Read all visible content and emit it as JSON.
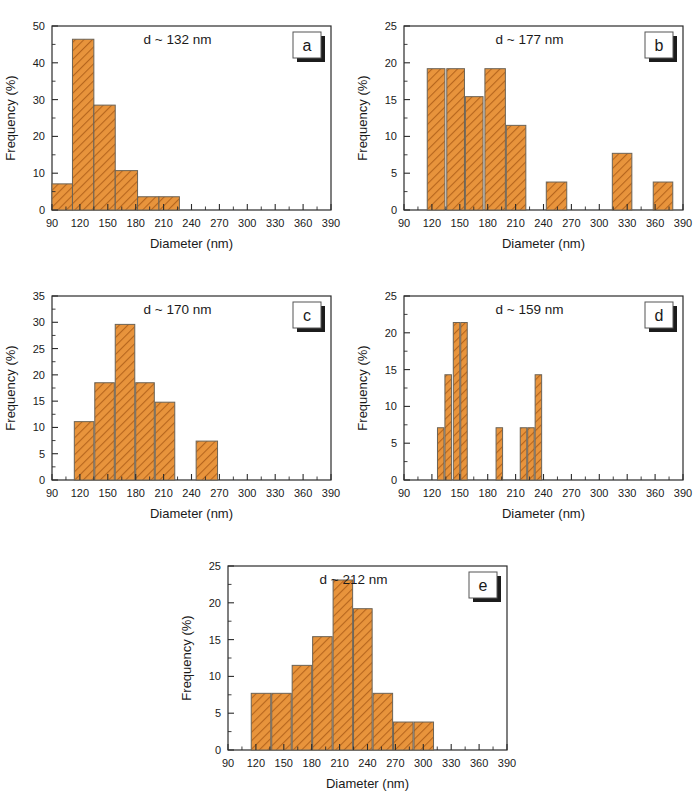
{
  "figure": {
    "axis_x_label": "Diameter (nm)",
    "axis_y_label": "Frequency (%)",
    "bar_fill_color": "#E8943C",
    "bar_hatch_color": "#B5651D",
    "bar_edge_color": "#6B6356"
  },
  "panels": [
    {
      "letter": "a",
      "annotation": "d ~ 132 nm",
      "chart_data": {
        "type": "bar",
        "title": "d ~ 132 nm",
        "xlabel": "Diameter (nm)",
        "ylabel": "Frequency (%)",
        "xlim": [
          90,
          390
        ],
        "ylim": [
          0,
          50
        ],
        "xticks": [
          90,
          120,
          150,
          180,
          210,
          240,
          270,
          300,
          330,
          360,
          390
        ],
        "yticks": [
          0,
          10,
          20,
          30,
          40,
          50
        ],
        "grid": false,
        "bin_edges": [
          90,
          112,
          135,
          158,
          182,
          205,
          227
        ],
        "bin_centers": [
          101,
          123,
          146,
          170,
          193,
          216
        ],
        "values": [
          7.1,
          46.4,
          28.5,
          10.7,
          3.6,
          3.6
        ]
      }
    },
    {
      "letter": "b",
      "annotation": "d ~ 177 nm",
      "chart_data": {
        "type": "bar",
        "title": "d ~ 177 nm",
        "xlabel": "Diameter (nm)",
        "ylabel": "Frequency (%)",
        "xlim": [
          90,
          390
        ],
        "ylim": [
          0,
          25
        ],
        "xticks": [
          90,
          120,
          150,
          180,
          210,
          240,
          270,
          300,
          330,
          360,
          390
        ],
        "yticks": [
          0,
          5,
          10,
          15,
          20,
          25
        ],
        "grid": false,
        "bars": [
          {
            "x0": 115,
            "x1": 134,
            "value": 19.2
          },
          {
            "x0": 136,
            "x1": 155,
            "value": 19.2
          },
          {
            "x0": 156,
            "x1": 175,
            "value": 15.4
          },
          {
            "x0": 177,
            "x1": 199,
            "value": 19.2
          },
          {
            "x0": 200,
            "x1": 221,
            "value": 11.5
          },
          {
            "x0": 243,
            "x1": 265,
            "value": 3.8
          },
          {
            "x0": 314,
            "x1": 335,
            "value": 7.7
          },
          {
            "x0": 358,
            "x1": 379,
            "value": 3.8
          }
        ]
      }
    },
    {
      "letter": "c",
      "annotation": "d ~ 170 nm",
      "chart_data": {
        "type": "bar",
        "title": "d ~ 170 nm",
        "xlabel": "Diameter (nm)",
        "ylabel": "Frequency (%)",
        "xlim": [
          90,
          390
        ],
        "ylim": [
          0,
          35
        ],
        "xticks": [
          90,
          120,
          150,
          180,
          210,
          240,
          270,
          300,
          330,
          360,
          390
        ],
        "yticks": [
          0,
          5,
          10,
          15,
          20,
          25,
          30,
          35
        ],
        "grid": false,
        "bars": [
          {
            "x0": 114,
            "x1": 135,
            "value": 11.1
          },
          {
            "x0": 136,
            "x1": 157,
            "value": 18.5
          },
          {
            "x0": 158,
            "x1": 179,
            "value": 29.6
          },
          {
            "x0": 180,
            "x1": 200,
            "value": 18.5
          },
          {
            "x0": 201,
            "x1": 222,
            "value": 14.8
          },
          {
            "x0": 245,
            "x1": 268,
            "value": 7.4
          }
        ]
      }
    },
    {
      "letter": "d",
      "annotation": "d ~ 159 nm",
      "chart_data": {
        "type": "bar",
        "title": "d ~ 159 nm",
        "xlabel": "Diameter (nm)",
        "ylabel": "Frequency (%)",
        "xlim": [
          90,
          390
        ],
        "ylim": [
          0,
          25
        ],
        "xticks": [
          90,
          120,
          150,
          180,
          210,
          240,
          270,
          300,
          330,
          360,
          390
        ],
        "yticks": [
          0,
          5,
          10,
          15,
          20,
          25
        ],
        "grid": false,
        "bars": [
          {
            "x0": 126,
            "x1": 133,
            "value": 7.1
          },
          {
            "x0": 134,
            "x1": 141,
            "value": 14.3
          },
          {
            "x0": 143,
            "x1": 150,
            "value": 21.4
          },
          {
            "x0": 151,
            "x1": 158,
            "value": 21.4
          },
          {
            "x0": 189,
            "x1": 196,
            "value": 7.1
          },
          {
            "x0": 215,
            "x1": 222,
            "value": 7.1
          },
          {
            "x0": 223,
            "x1": 230,
            "value": 7.1
          },
          {
            "x0": 231,
            "x1": 238,
            "value": 14.3
          }
        ]
      }
    },
    {
      "letter": "e",
      "annotation": "d ~ 212 nm",
      "chart_data": {
        "type": "bar",
        "title": "d ~ 212 nm",
        "xlabel": "Diameter (nm)",
        "ylabel": "Frequency (%)",
        "xlim": [
          90,
          390
        ],
        "ylim": [
          0,
          25
        ],
        "xticks": [
          90,
          120,
          150,
          180,
          210,
          240,
          270,
          300,
          330,
          360,
          390
        ],
        "yticks": [
          0,
          5,
          10,
          15,
          20,
          25
        ],
        "grid": false,
        "bars": [
          {
            "x0": 115,
            "x1": 136,
            "value": 7.7
          },
          {
            "x0": 137,
            "x1": 158,
            "value": 7.7
          },
          {
            "x0": 159,
            "x1": 180,
            "value": 11.5
          },
          {
            "x0": 181,
            "x1": 202,
            "value": 15.4
          },
          {
            "x0": 203,
            "x1": 224,
            "value": 23.1
          },
          {
            "x0": 225,
            "x1": 245,
            "value": 19.2
          },
          {
            "x0": 246,
            "x1": 267,
            "value": 7.7
          },
          {
            "x0": 268,
            "x1": 289,
            "value": 3.8
          },
          {
            "x0": 290,
            "x1": 311,
            "value": 3.8
          }
        ]
      }
    }
  ]
}
